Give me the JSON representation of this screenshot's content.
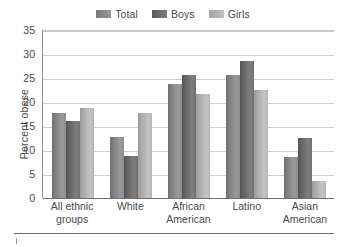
{
  "chart_data": {
    "type": "bar",
    "title": "",
    "xlabel": "",
    "ylabel": "Percent obese",
    "ylim": [
      0,
      35
    ],
    "yticks": [
      0,
      5,
      10,
      15,
      20,
      25,
      30,
      35
    ],
    "grid": true,
    "legend_position": "top-center",
    "categories": [
      "All ethnic groups",
      "White",
      "African American",
      "Latino",
      "Asian American"
    ],
    "category_lines": [
      [
        "All ethnic",
        "groups"
      ],
      [
        "White",
        ""
      ],
      [
        "African",
        "American"
      ],
      [
        "Latino",
        ""
      ],
      [
        "Asian",
        "American"
      ]
    ],
    "series": [
      {
        "name": "Total",
        "color": "#8a8a8a",
        "values": [
          17.8,
          12.8,
          23.8,
          25.6,
          8.5
        ]
      },
      {
        "name": "Boys",
        "color": "#6e6e6e",
        "values": [
          16.0,
          8.8,
          25.7,
          28.6,
          12.5
        ]
      },
      {
        "name": "Girls",
        "color": "#b4b4b4",
        "values": [
          18.8,
          17.8,
          21.6,
          22.6,
          3.5
        ]
      }
    ]
  },
  "axis": {
    "y_label": "Percent obese",
    "y_tick_labels": [
      "35",
      "30",
      "25",
      "20",
      "15",
      "10",
      "5",
      "0"
    ]
  },
  "legend": {
    "entries": [
      {
        "label": "Total"
      },
      {
        "label": "Boys"
      },
      {
        "label": "Girls"
      }
    ]
  },
  "colors": {
    "series_total": "#8a8a8a",
    "series_boys": "#6e6e6e",
    "series_girls": "#b4b4b4",
    "gridline": "#cdcdcd",
    "axis": "#6f6f6f",
    "text": "#4a4a4a"
  }
}
